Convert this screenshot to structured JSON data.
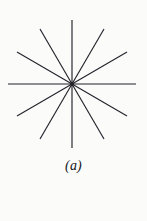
{
  "figure": {
    "caption": "(a)",
    "background_color": "#fbfbfa",
    "line_color": "#23232a",
    "line_width": 1.15
  },
  "chart_data": {
    "type": "scatter",
    "title": "(a)",
    "subtitle": "",
    "xlabel": "",
    "ylabel": "",
    "center": {
      "x": 72,
      "y": 84
    },
    "ray_count": 12,
    "line_count": 6,
    "angle_step_degrees": 30,
    "radius_px": 64,
    "grid": false,
    "legend": null,
    "rays": [
      {
        "index": 1,
        "angle_degrees": 0,
        "x1": 72,
        "y1": 84,
        "x2": 136,
        "y2": 84
      },
      {
        "index": 2,
        "angle_degrees": 30,
        "x1": 72,
        "y1": 84,
        "x2": 127,
        "y2": 52
      },
      {
        "index": 3,
        "angle_degrees": 60,
        "x1": 72,
        "y1": 84,
        "x2": 104,
        "y2": 29
      },
      {
        "index": 4,
        "angle_degrees": 90,
        "x1": 72,
        "y1": 84,
        "x2": 72,
        "y2": 20
      },
      {
        "index": 5,
        "angle_degrees": 120,
        "x1": 72,
        "y1": 84,
        "x2": 40,
        "y2": 29
      },
      {
        "index": 6,
        "angle_degrees": 150,
        "x1": 72,
        "y1": 84,
        "x2": 17,
        "y2": 52
      },
      {
        "index": 7,
        "angle_degrees": 180,
        "x1": 72,
        "y1": 84,
        "x2": 8,
        "y2": 84
      },
      {
        "index": 8,
        "angle_degrees": 210,
        "x1": 72,
        "y1": 84,
        "x2": 17,
        "y2": 116
      },
      {
        "index": 9,
        "angle_degrees": 240,
        "x1": 72,
        "y1": 84,
        "x2": 40,
        "y2": 139
      },
      {
        "index": 10,
        "angle_degrees": 270,
        "x1": 72,
        "y1": 84,
        "x2": 72,
        "y2": 148
      },
      {
        "index": 11,
        "angle_degrees": 300,
        "x1": 72,
        "y1": 84,
        "x2": 104,
        "y2": 139
      },
      {
        "index": 12,
        "angle_degrees": 330,
        "x1": 72,
        "y1": 84,
        "x2": 127,
        "y2": 116
      }
    ]
  }
}
